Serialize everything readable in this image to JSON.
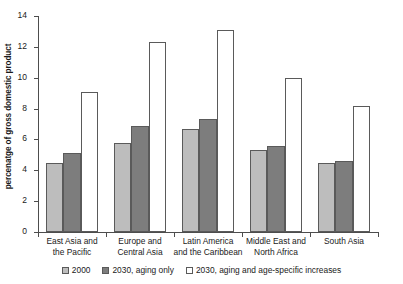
{
  "chart_data": {
    "type": "bar",
    "title": "",
    "subtitle": "",
    "xlabel": "",
    "ylabel": "percenatge of gross domestic product",
    "ylim": [
      0,
      14
    ],
    "yticks": [
      0,
      2,
      4,
      6,
      8,
      10,
      12,
      14
    ],
    "ytick_labels": [
      "0",
      "2",
      "4",
      "6",
      "8",
      "10",
      "12",
      "14"
    ],
    "grid": false,
    "legend_position": "bottom-center",
    "categories": [
      "East Asia and\nthe Pacific",
      "Europe and\nCentral Asia",
      "Latin America\nand the Caribbean",
      "Middle East and\nNorth Africa",
      "South Asia"
    ],
    "category_lines": [
      [
        "East Asia and",
        "the Pacific"
      ],
      [
        "Europe and",
        "Central Asia"
      ],
      [
        "Latin America",
        "and the Caribbean"
      ],
      [
        "Middle East and",
        "North Africa"
      ],
      [
        "South Asia"
      ]
    ],
    "series": [
      {
        "name": "2000",
        "color": "#bdbdbd",
        "values": [
          4.5,
          5.8,
          6.7,
          5.3,
          4.5
        ]
      },
      {
        "name": "2030, aging only",
        "color": "#7d7d7d",
        "values": [
          5.1,
          6.9,
          7.3,
          5.6,
          4.6
        ]
      },
      {
        "name": "2030, aging and age-specific increases",
        "color": "#ffffff",
        "values": [
          9.1,
          12.3,
          13.1,
          10.0,
          8.2
        ]
      }
    ]
  },
  "axis": {
    "tick_0": "0",
    "tick_1": "2",
    "tick_2": "4",
    "tick_3": "6",
    "tick_4": "8",
    "tick_5": "10",
    "tick_6": "12",
    "tick_7": "14"
  },
  "legend": {
    "items": [
      {
        "label": "2000"
      },
      {
        "label": "2030, aging only"
      },
      {
        "label": "2030, aging and age-specific increases"
      }
    ]
  }
}
